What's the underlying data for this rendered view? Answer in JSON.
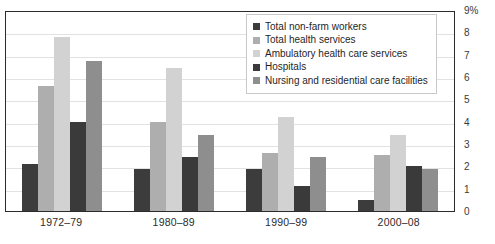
{
  "chart_data": {
    "type": "bar",
    "title": "",
    "xlabel": "",
    "ylabel": "",
    "ylim": [
      0,
      9
    ],
    "grid": true,
    "legend_position": "top-center-right",
    "y_unit": "%",
    "y_ticks": [
      "9%",
      "8",
      "7",
      "6",
      "5",
      "4",
      "3",
      "2",
      "1",
      "0"
    ],
    "categories": [
      "1972–79",
      "1980–89",
      "1990–99",
      "2000–08"
    ],
    "series": [
      {
        "name": "Total non-farm workers",
        "color": "#3c3c3c",
        "values": [
          2.1,
          1.9,
          1.9,
          0.5
        ]
      },
      {
        "name": "Total health services",
        "color": "#aeaeae",
        "values": [
          5.6,
          4.0,
          2.6,
          2.5
        ]
      },
      {
        "name": "Ambulatory health care services",
        "color": "#d2d2d2",
        "values": [
          7.8,
          6.4,
          4.2,
          3.4
        ]
      },
      {
        "name": "Hospitals",
        "color": "#3a3a3a",
        "values": [
          4.0,
          2.4,
          1.1,
          2.0
        ]
      },
      {
        "name": "Nursing and residential care facilities",
        "color": "#8e8e8e",
        "values": [
          6.7,
          3.4,
          2.4,
          1.9
        ]
      }
    ]
  },
  "axes": {
    "y_tick_labels": [
      "9%",
      "8",
      "7",
      "6",
      "5",
      "4",
      "3",
      "2",
      "1",
      "0"
    ],
    "x_tick_labels": [
      "1972–79",
      "1980–89",
      "1990–99",
      "2000–08"
    ]
  },
  "legend": {
    "items": [
      {
        "label": "Total non-farm workers",
        "color": "#3c3c3c"
      },
      {
        "label": "Total health services",
        "color": "#aeaeae"
      },
      {
        "label": "Ambulatory health care services",
        "color": "#d2d2d2"
      },
      {
        "label": "Hospitals",
        "color": "#3a3a3a"
      },
      {
        "label": "Nursing and residential care facilities",
        "color": "#8e8e8e"
      }
    ]
  },
  "colors": {
    "frame": "#2b2b2b",
    "gridline": "#e2e2e2",
    "background": "#ffffff",
    "text": "#1f1f1f"
  }
}
